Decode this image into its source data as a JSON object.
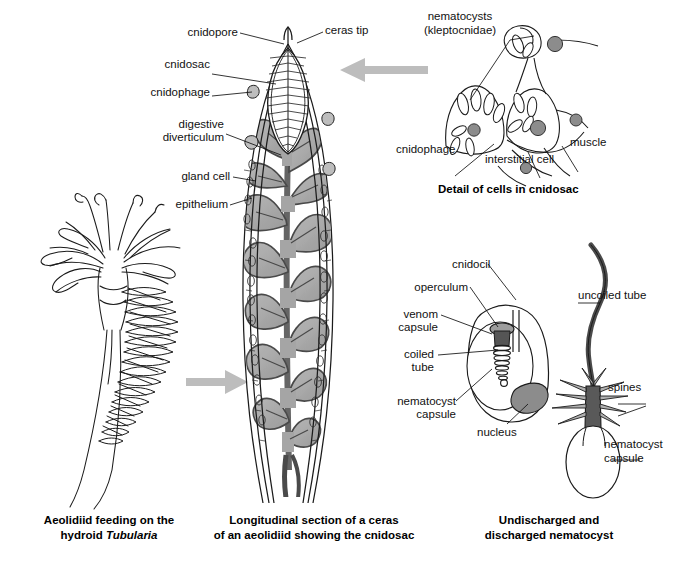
{
  "figure": {
    "background_color": "#ffffff",
    "ink_color": "#1a1a1a",
    "fill_grey": "#a9a9a9",
    "fill_grey_light": "#c8c8c8",
    "fill_dark": "#6e6e6e",
    "arrow_color": "#b5b5b5"
  },
  "panels": [
    {
      "id": "hydroid",
      "caption_line1": "Aeolidiid feeding on the",
      "caption_line2_pre": "hydroid ",
      "caption_line2_italic": "Tubularia"
    },
    {
      "id": "ceras",
      "caption_line1": "Longitudinal section of a ceras",
      "caption_line2": "of an aeolidiid showing the cnidosac"
    },
    {
      "id": "nematocyst",
      "caption_line1": "Undischarged and",
      "caption_line2": "discharged nematocyst"
    }
  ],
  "ceras_labels": [
    {
      "key": "cnidopore",
      "text": "cnidopore"
    },
    {
      "key": "ceras_tip",
      "text": "ceras tip"
    },
    {
      "key": "cnidosac",
      "text": "cnidosac"
    },
    {
      "key": "cnidophage",
      "text": "cnidophage"
    },
    {
      "key": "digestive_diverticulum_l1",
      "text": "digestive"
    },
    {
      "key": "digestive_diverticulum_l2",
      "text": "diverticulum"
    },
    {
      "key": "gland_cell",
      "text": "gland cell"
    },
    {
      "key": "epithelium",
      "text": "epithelium"
    }
  ],
  "cnidosac_detail": {
    "heading": "Detail of cells in cnidosac",
    "labels": [
      {
        "key": "nematocysts_l1",
        "text": "nematocysts"
      },
      {
        "key": "nematocysts_l2",
        "text": "(kleptocnidae)"
      },
      {
        "key": "cnidophage",
        "text": "cnidophage"
      },
      {
        "key": "interstitial_cell",
        "text": "interstitial cell"
      },
      {
        "key": "muscle",
        "text": "muscle"
      }
    ]
  },
  "undischarged_nematocyst": {
    "labels": [
      {
        "key": "cnidocil",
        "text": "cnidocil"
      },
      {
        "key": "operculum",
        "text": "operculum"
      },
      {
        "key": "venom_l1",
        "text": "venom"
      },
      {
        "key": "venom_l2",
        "text": "capsule"
      },
      {
        "key": "coiled_l1",
        "text": "coiled"
      },
      {
        "key": "coiled_l2",
        "text": "tube"
      },
      {
        "key": "nematocyst_capsule_l1",
        "text": "nematocyst"
      },
      {
        "key": "nematocyst_capsule_l2",
        "text": "capsule"
      },
      {
        "key": "nucleus",
        "text": "nucleus"
      }
    ]
  },
  "discharged_nematocyst": {
    "labels": [
      {
        "key": "uncoiled_tube",
        "text": "uncoiled tube"
      },
      {
        "key": "spines",
        "text": "spines"
      },
      {
        "key": "nematocyst_capsule_l1",
        "text": "nematocyst"
      },
      {
        "key": "nematocyst_capsule_l2",
        "text": "capsule"
      }
    ]
  },
  "arrows": [
    {
      "key": "detail_arrow",
      "direction": "left",
      "from": "cnidosac-detail",
      "to": "ceras-cnidosac"
    },
    {
      "key": "ceras_arrow",
      "direction": "right",
      "from": "hydroid",
      "to": "ceras"
    }
  ]
}
